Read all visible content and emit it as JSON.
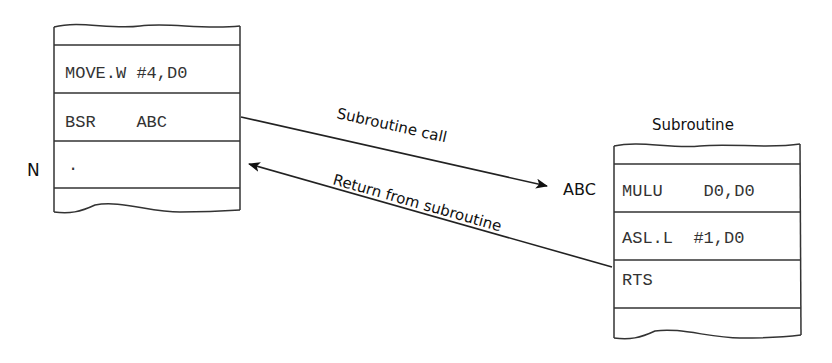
{
  "main_program": {
    "rows": [
      {
        "text": "MOVE.W #4,D0"
      },
      {
        "text": "BSR    ABC"
      },
      {
        "text": "."
      }
    ],
    "label_n": "N"
  },
  "subroutine": {
    "title": "Subroutine",
    "entry_label": "ABC",
    "rows": [
      {
        "text": "MULU    D0,D0"
      },
      {
        "text": "ASL.L  #1,D0"
      },
      {
        "text": "RTS"
      }
    ]
  },
  "arrows": {
    "call_label": "Subroutine call",
    "return_label": "Return from subroutine"
  },
  "colors": {
    "line": "#222222",
    "text": "#333333"
  }
}
